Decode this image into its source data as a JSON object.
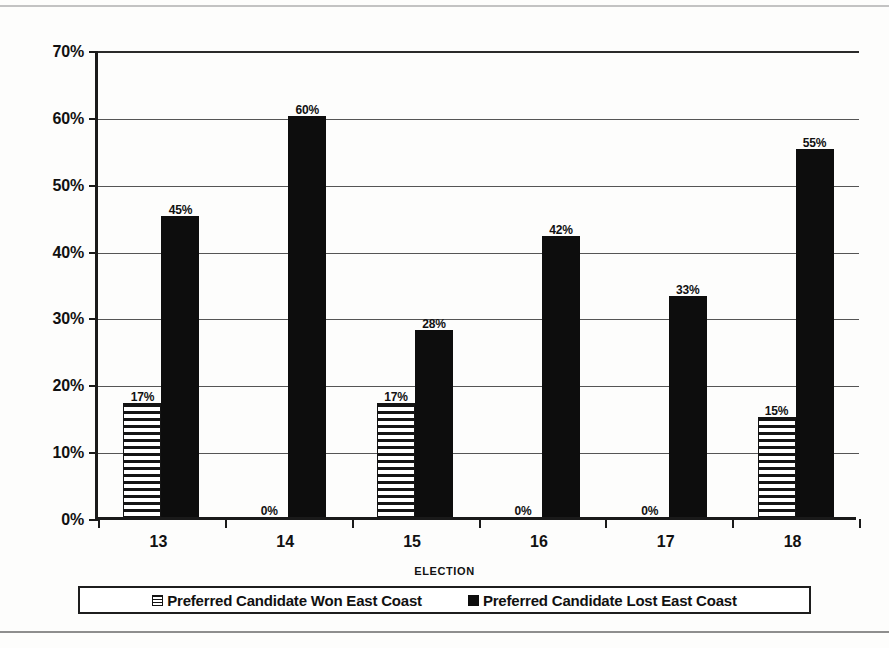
{
  "chart_data": {
    "type": "bar",
    "title": "",
    "xlabel": "ELECTION",
    "ylabel": "",
    "categories": [
      "13",
      "14",
      "15",
      "16",
      "17",
      "18"
    ],
    "series": [
      {
        "name": "Preferred Candidate Won East Coast",
        "pattern": "horizontal-hatch",
        "color": "#141414",
        "values": [
          17,
          0,
          17,
          0,
          0,
          15
        ],
        "labels": [
          "17%",
          "0%",
          "17%",
          "0%",
          "0%",
          "15%"
        ]
      },
      {
        "name": "Preferred Candidate Lost East Coast",
        "pattern": "solid",
        "color": "#0d0d0d",
        "values": [
          45,
          60,
          28,
          42,
          33,
          55
        ],
        "labels": [
          "45%",
          "60%",
          "28%",
          "42%",
          "33%",
          "55%"
        ]
      }
    ],
    "ylim": [
      0,
      70
    ],
    "ytick_values": [
      0,
      10,
      20,
      30,
      40,
      50,
      60,
      70
    ],
    "ytick_labels": [
      "0%",
      "10%",
      "20%",
      "30%",
      "40%",
      "50%",
      "60%",
      "70%"
    ],
    "grid": true,
    "legend_position": "bottom"
  },
  "legend": {
    "entries": [
      {
        "label": "Preferred Candidate Won East Coast",
        "swatch": "hatch-square-icon"
      },
      {
        "label": "Preferred Candidate Lost East Coast",
        "swatch": "solid-square-icon"
      }
    ]
  },
  "axis": {
    "x_title": "ELECTION"
  }
}
